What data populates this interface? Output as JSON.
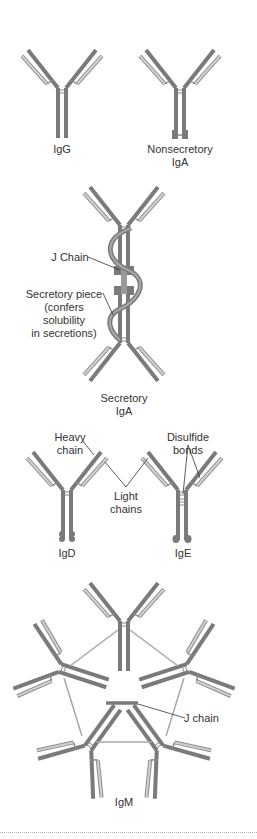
{
  "colors": {
    "heavy_chain": "#7a7a7a",
    "light_chain_outline": "#8a8a8a",
    "light_chain_fill": "#d2d2d2",
    "pointer_line": "#333333",
    "text": "#333333"
  },
  "diagrams": {
    "igg": {
      "label": "IgG"
    },
    "nonsecretory_iga": {
      "label_line1": "Nonsecretory",
      "label_line2": "IgA"
    },
    "secretory_iga": {
      "label_line1": "Secretory",
      "label_line2": "IgA",
      "annotations": {
        "j_chain": "J Chain",
        "secretory_piece_line1": "Secretory piece",
        "secretory_piece_line2": "(confers",
        "secretory_piece_line3": "solubility",
        "secretory_piece_line4": "in secretions)"
      }
    },
    "igd": {
      "label": "IgD"
    },
    "ige": {
      "label": "IgE"
    },
    "shared_annotations": {
      "heavy_chain_line1": "Heavy",
      "heavy_chain_line2": "chain",
      "light_chains_line1": "Light",
      "light_chains_line2": "chains",
      "disulfide_line1": "Disulfide",
      "disulfide_line2": "bonds"
    },
    "igm": {
      "label": "IgM",
      "annotations": {
        "j_chain": "J chain"
      }
    }
  }
}
